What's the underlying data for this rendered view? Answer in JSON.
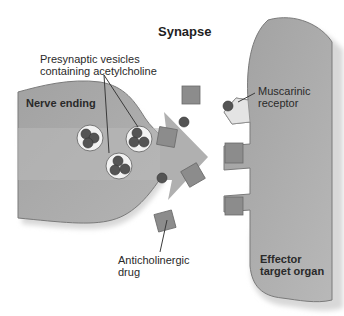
{
  "diagram": {
    "title": "Synapse",
    "labels": {
      "vesicles": "Presynaptic vesicles\ncontaining acetylcholine",
      "nerve_ending": "Nerve ending",
      "receptor": "Muscarinic\nreceptor",
      "drug": "Anticholinergic\ndrug",
      "effector": "Effector\ntarget organ"
    },
    "colors": {
      "cell_fill": "#a9a9a9",
      "cell_edge": "#7a7a7a",
      "band_fill": "#b9b9b9",
      "drug_square": "#8c8c8c",
      "ach_dot": "#545454",
      "vesicle_fill": "#f2f2f2",
      "leader_line": "#3a3a3a"
    }
  }
}
